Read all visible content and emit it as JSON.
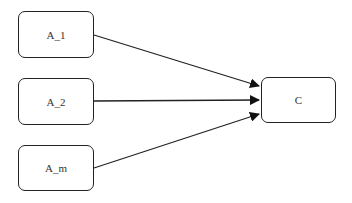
{
  "diagram": {
    "type": "flow",
    "nodes": [
      {
        "id": "A_1",
        "label": "A_1",
        "x": 18,
        "y": 11,
        "w": 76,
        "h": 47
      },
      {
        "id": "A_2",
        "label": "A_2",
        "x": 18,
        "y": 78,
        "w": 76,
        "h": 47
      },
      {
        "id": "A_m",
        "label": "A_m",
        "x": 18,
        "y": 145,
        "w": 76,
        "h": 46
      },
      {
        "id": "C",
        "label": "C",
        "x": 261,
        "y": 77,
        "w": 75,
        "h": 46
      }
    ],
    "edges": [
      {
        "from": "A_1",
        "to": "C"
      },
      {
        "from": "A_2",
        "to": "C"
      },
      {
        "from": "A_m",
        "to": "C"
      }
    ],
    "colors": {
      "stroke": "#222222",
      "text": "#333333",
      "background": "#ffffff"
    }
  }
}
